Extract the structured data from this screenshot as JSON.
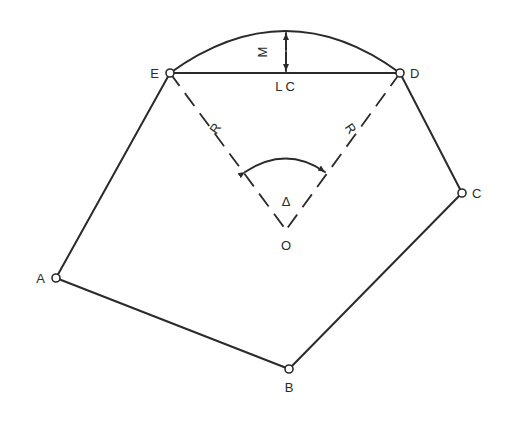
{
  "diagram": {
    "type": "circular-curve-parcel",
    "colors": {
      "ink": "#2a2a2a",
      "background": "#ffffff"
    },
    "points": [
      {
        "id": "A",
        "label": "A",
        "x": 56,
        "y": 278
      },
      {
        "id": "B",
        "label": "B",
        "x": 289,
        "y": 369
      },
      {
        "id": "C",
        "label": "C",
        "x": 462,
        "y": 193
      },
      {
        "id": "D",
        "label": "D",
        "x": 400,
        "y": 73
      },
      {
        "id": "E",
        "label": "E",
        "x": 170,
        "y": 73
      },
      {
        "id": "O",
        "label": "O",
        "x": 286,
        "y": 230
      }
    ],
    "labels": {
      "long_chord": "L C",
      "middle_ordinate": "M",
      "radius_left": "R",
      "radius_right": "R",
      "central_angle": "Δ",
      "center": "O"
    }
  }
}
